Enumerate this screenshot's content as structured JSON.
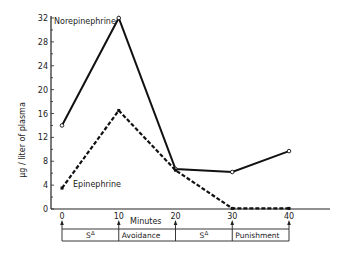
{
  "chart_data": {
    "type": "line",
    "title": "",
    "xlabel": "Minutes",
    "ylabel": "μg / liter of plasma",
    "x": [
      0,
      10,
      20,
      30,
      40
    ],
    "xticks": [
      "0",
      "10",
      "20",
      "30",
      "40"
    ],
    "yticks": [
      "0",
      "4",
      "8",
      "12",
      "16",
      "20",
      "24",
      "28",
      "32"
    ],
    "ylim": [
      0,
      32
    ],
    "xlim": [
      0,
      40
    ],
    "grid": false,
    "legend_position": "inline labels",
    "series": [
      {
        "name": "Norepinephrine",
        "style": "solid",
        "marker": "open-circle",
        "values": [
          14.0,
          32.0,
          6.7,
          6.2,
          9.7
        ]
      },
      {
        "name": "Epinephrine",
        "style": "dashed",
        "marker": "filled-square",
        "values": [
          3.5,
          16.5,
          6.5,
          0.1,
          0.1
        ]
      }
    ],
    "annotations": {
      "phases": [
        {
          "label": "S",
          "superscript": "Δ",
          "from": 0,
          "to": 10
        },
        {
          "label": "Avoidance",
          "superscript": "",
          "from": 10,
          "to": 20
        },
        {
          "label": "S",
          "superscript": "Δ",
          "from": 20,
          "to": 30
        },
        {
          "label": "Punishment",
          "superscript": "",
          "from": 30,
          "to": 40
        }
      ]
    }
  }
}
